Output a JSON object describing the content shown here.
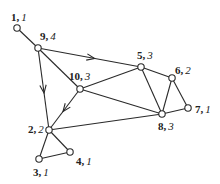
{
  "diagram": {
    "type": "weighted-graph",
    "nodes": [
      {
        "id": "1",
        "weight": "1",
        "x": 17,
        "y": 28,
        "lx": 11,
        "ly": 21
      },
      {
        "id": "9",
        "weight": "4",
        "x": 38,
        "y": 48,
        "lx": 40,
        "ly": 40
      },
      {
        "id": "10",
        "weight": "3",
        "x": 80,
        "y": 89,
        "lx": 69,
        "ly": 80
      },
      {
        "id": "5",
        "weight": "3",
        "x": 141,
        "y": 67,
        "lx": 137,
        "ly": 59
      },
      {
        "id": "6",
        "weight": "2",
        "x": 172,
        "y": 78,
        "lx": 175,
        "ly": 74
      },
      {
        "id": "7",
        "weight": "1",
        "x": 188,
        "y": 108,
        "lx": 195,
        "ly": 113
      },
      {
        "id": "8",
        "weight": "3",
        "x": 162,
        "y": 114,
        "lx": 158,
        "ly": 130
      },
      {
        "id": "2",
        "weight": "2",
        "x": 49,
        "y": 130,
        "lx": 28,
        "ly": 133
      },
      {
        "id": "3",
        "weight": "1",
        "x": 39,
        "y": 159,
        "lx": 33,
        "ly": 176
      },
      {
        "id": "4",
        "weight": "1",
        "x": 70,
        "y": 152,
        "lx": 76,
        "ly": 165
      }
    ],
    "edges": [
      {
        "from": "1",
        "to": "9",
        "directed": false
      },
      {
        "from": "9",
        "to": "2",
        "directed": true
      },
      {
        "from": "9",
        "to": "5",
        "directed": true
      },
      {
        "from": "9",
        "to": "10",
        "directed": false
      },
      {
        "from": "10",
        "to": "5",
        "directed": false
      },
      {
        "from": "10",
        "to": "8",
        "directed": false
      },
      {
        "from": "10",
        "to": "2",
        "directed": true
      },
      {
        "from": "2",
        "to": "8",
        "directed": false
      },
      {
        "from": "2",
        "to": "3",
        "directed": false
      },
      {
        "from": "2",
        "to": "4",
        "directed": false
      },
      {
        "from": "3",
        "to": "4",
        "directed": false
      },
      {
        "from": "5",
        "to": "6",
        "directed": false
      },
      {
        "from": "5",
        "to": "8",
        "directed": false
      },
      {
        "from": "6",
        "to": "8",
        "directed": false
      },
      {
        "from": "6",
        "to": "7",
        "directed": false
      },
      {
        "from": "8",
        "to": "7",
        "directed": false
      }
    ],
    "separator": ", ",
    "colors": {
      "stroke": "#2a2a2a",
      "node_fill": "#ffffff",
      "text": "#222222"
    }
  }
}
